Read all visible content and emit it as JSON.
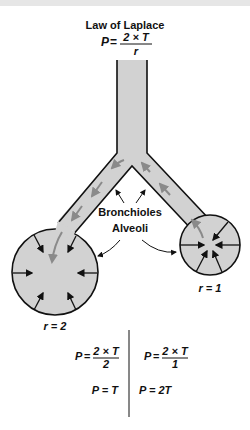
{
  "title": "Law of Laplace",
  "main_formula": {
    "lhs": "P",
    "eq": "=",
    "numerator": "2 × T",
    "denominator": "r"
  },
  "labels": {
    "bronchioles": "Bronchioles",
    "alveoli": "Alveoli"
  },
  "alveoli": [
    {
      "name": "large",
      "radius_label": "r = 2"
    },
    {
      "name": "small",
      "radius_label": "r = 1"
    }
  ],
  "results": {
    "left": {
      "formula": {
        "lhs": "P",
        "eq": "=",
        "numerator": "2 × T",
        "denominator": "2"
      },
      "result": "P = T"
    },
    "right": {
      "formula": {
        "lhs": "P",
        "eq": "=",
        "numerator": "2 × T",
        "denominator": "1"
      },
      "result": "P = 2T"
    }
  },
  "colors": {
    "fill": "#d2d2d2",
    "stroke": "#111111",
    "flow_arrow": "#8a8a8a",
    "background": "#ffffff"
  }
}
